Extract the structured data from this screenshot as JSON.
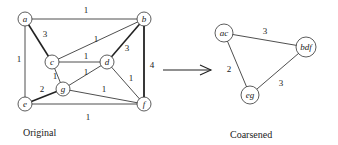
{
  "original": {
    "caption": "Original",
    "nodes": [
      {
        "id": "a",
        "label": "a",
        "x": 25,
        "y": 19
      },
      {
        "id": "b",
        "label": "b",
        "x": 144,
        "y": 19
      },
      {
        "id": "c",
        "label": "c",
        "x": 52,
        "y": 62
      },
      {
        "id": "d",
        "label": "d",
        "x": 107,
        "y": 62
      },
      {
        "id": "g",
        "label": "g",
        "x": 63,
        "y": 89
      },
      {
        "id": "e",
        "label": "e",
        "x": 25,
        "y": 104
      },
      {
        "id": "f",
        "label": "f",
        "x": 144,
        "y": 104
      }
    ],
    "edges": [
      {
        "from": "a",
        "to": "b",
        "weight": "1",
        "lx": 86,
        "ly": 13,
        "w": 0.8
      },
      {
        "from": "a",
        "to": "c",
        "weight": "3",
        "lx": 45,
        "ly": 37,
        "w": 1.6
      },
      {
        "from": "a",
        "to": "e",
        "weight": "1",
        "lx": 19,
        "ly": 62,
        "w": 0.8
      },
      {
        "from": "b",
        "to": "c",
        "weight": "1",
        "lx": 96,
        "ly": 42,
        "w": 0.8
      },
      {
        "from": "b",
        "to": "d",
        "weight": "3",
        "lx": 127,
        "ly": 51,
        "w": 1.6
      },
      {
        "from": "b",
        "to": "f",
        "weight": "4",
        "lx": 152,
        "ly": 68,
        "w": 1.8
      },
      {
        "from": "c",
        "to": "d",
        "weight": "1",
        "lx": 86,
        "ly": 59,
        "w": 0.8
      },
      {
        "from": "c",
        "to": "g",
        "weight": "1",
        "lx": 55,
        "ly": 79,
        "w": 0.8
      },
      {
        "from": "d",
        "to": "g",
        "weight": "1",
        "lx": 86,
        "ly": 75,
        "w": 0.8
      },
      {
        "from": "d",
        "to": "f",
        "weight": "1",
        "lx": 131,
        "ly": 81,
        "w": 0.8
      },
      {
        "from": "g",
        "to": "f",
        "weight": "1",
        "lx": 104,
        "ly": 92,
        "w": 0.8
      },
      {
        "from": "e",
        "to": "g",
        "weight": "2",
        "lx": 42,
        "ly": 92,
        "w": 1.6
      },
      {
        "from": "e",
        "to": "f",
        "weight": "1",
        "lx": 88,
        "ly": 120,
        "w": 0.8
      }
    ]
  },
  "arrow": {
    "x1": 163,
    "y1": 70,
    "x2": 211,
    "y2": 70
  },
  "coarsened": {
    "caption": "Coarsened",
    "nodes": [
      {
        "id": "ac",
        "label": "ac",
        "x": 224,
        "y": 33
      },
      {
        "id": "bdf",
        "label": "bdf",
        "x": 306,
        "y": 47
      },
      {
        "id": "eg",
        "label": "eg",
        "x": 250,
        "y": 95
      }
    ],
    "edges": [
      {
        "from": "ac",
        "to": "bdf",
        "weight": "3",
        "lx": 265,
        "ly": 34,
        "w": 0.8
      },
      {
        "from": "ac",
        "to": "eg",
        "weight": "2",
        "lx": 229,
        "ly": 72,
        "w": 0.8
      },
      {
        "from": "bdf",
        "to": "eg",
        "weight": "3",
        "lx": 281,
        "ly": 86,
        "w": 0.8
      }
    ]
  }
}
